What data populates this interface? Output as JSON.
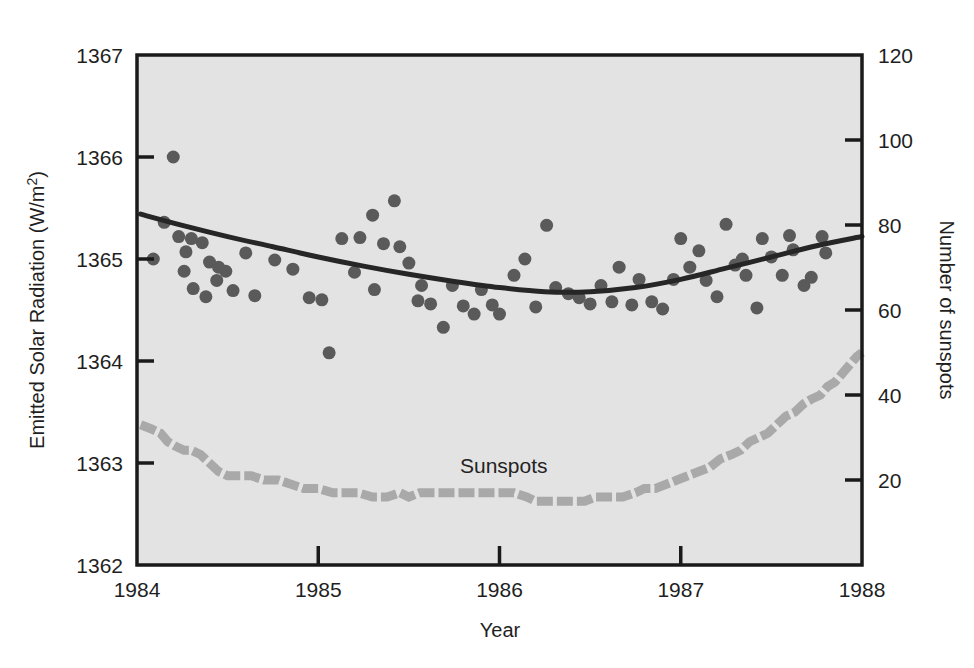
{
  "figure": {
    "background_color": "#ffffff",
    "plot_background_color": "#e3e3e3",
    "frame_color": "#1a1a1a"
  },
  "axes": {
    "left": {
      "title_main": "Emitted Solar Radiation (W/m",
      "title_sup": "2",
      "title_close": ")",
      "ticks": [
        "1367",
        "1366",
        "1365",
        "1364",
        "1363",
        "1362"
      ],
      "min": 1362,
      "max": 1367
    },
    "right": {
      "title": "Number of sunspots",
      "ticks": [
        "120",
        "100",
        "80",
        "60",
        "40",
        "20"
      ],
      "min": 0,
      "max": 120
    },
    "bottom": {
      "title": "Year",
      "ticks": [
        "1984",
        "1985",
        "1986",
        "1987",
        "1988"
      ],
      "min": 1984,
      "max": 1988
    }
  },
  "annotations": [
    {
      "name": "sunspots-label",
      "text": "Sunspots",
      "x": 460,
      "y": 473
    }
  ],
  "colors": {
    "scatter_marker": "#5a5a5a",
    "trend_line": "#262626",
    "sunspot_line": "#a9a9a9",
    "axis_text": "#1f1f1f"
  },
  "chart_data": {
    "type": "scatter",
    "title": "",
    "xlabel": "Year",
    "ylabel": "Emitted Solar Radiation (W/m2)",
    "ylabel_right": "Number of sunspots",
    "xlim": [
      1984,
      1988
    ],
    "ylim": [
      1362,
      1367
    ],
    "ylim_right": [
      0,
      120
    ],
    "grid": false,
    "legend": "none",
    "series": [
      {
        "name": "Emitted Solar Radiation",
        "type": "scatter",
        "axis": "left",
        "marker": "circle",
        "color": "#5a5a5a",
        "points": [
          [
            1984.09,
            1365.0
          ],
          [
            1984.15,
            1365.36
          ],
          [
            1984.2,
            1366.0
          ],
          [
            1984.23,
            1365.22
          ],
          [
            1984.27,
            1365.07
          ],
          [
            1984.26,
            1364.88
          ],
          [
            1984.3,
            1365.2
          ],
          [
            1984.36,
            1365.16
          ],
          [
            1984.31,
            1364.71
          ],
          [
            1984.4,
            1364.97
          ],
          [
            1984.45,
            1364.92
          ],
          [
            1984.49,
            1364.88
          ],
          [
            1984.44,
            1364.79
          ],
          [
            1984.38,
            1364.63
          ],
          [
            1984.53,
            1364.69
          ],
          [
            1984.6,
            1365.06
          ],
          [
            1984.65,
            1364.64
          ],
          [
            1984.76,
            1364.99
          ],
          [
            1984.86,
            1364.9
          ],
          [
            1984.95,
            1364.62
          ],
          [
            1985.02,
            1364.6
          ],
          [
            1985.06,
            1364.08
          ],
          [
            1985.13,
            1365.2
          ],
          [
            1985.2,
            1364.87
          ],
          [
            1985.23,
            1365.21
          ],
          [
            1985.3,
            1365.43
          ],
          [
            1985.31,
            1364.7
          ],
          [
            1985.36,
            1365.15
          ],
          [
            1985.42,
            1365.57
          ],
          [
            1985.45,
            1365.12
          ],
          [
            1985.5,
            1364.96
          ],
          [
            1985.55,
            1364.59
          ],
          [
            1985.57,
            1364.74
          ],
          [
            1985.62,
            1364.56
          ],
          [
            1985.69,
            1364.33
          ],
          [
            1985.74,
            1364.74
          ],
          [
            1985.8,
            1364.54
          ],
          [
            1985.86,
            1364.46
          ],
          [
            1985.9,
            1364.7
          ],
          [
            1985.96,
            1364.55
          ],
          [
            1986.0,
            1364.46
          ],
          [
            1986.08,
            1364.84
          ],
          [
            1986.14,
            1365.0
          ],
          [
            1986.2,
            1364.53
          ],
          [
            1986.26,
            1365.33
          ],
          [
            1986.31,
            1364.72
          ],
          [
            1986.38,
            1364.66
          ],
          [
            1986.44,
            1364.62
          ],
          [
            1986.5,
            1364.56
          ],
          [
            1986.56,
            1364.74
          ],
          [
            1986.62,
            1364.58
          ],
          [
            1986.66,
            1364.92
          ],
          [
            1986.73,
            1364.55
          ],
          [
            1986.77,
            1364.8
          ],
          [
            1986.84,
            1364.58
          ],
          [
            1986.9,
            1364.51
          ],
          [
            1986.96,
            1364.8
          ],
          [
            1987.0,
            1365.2
          ],
          [
            1987.05,
            1364.92
          ],
          [
            1987.1,
            1365.08
          ],
          [
            1987.14,
            1364.79
          ],
          [
            1987.2,
            1364.63
          ],
          [
            1987.25,
            1365.34
          ],
          [
            1987.3,
            1364.94
          ],
          [
            1987.34,
            1365.0
          ],
          [
            1987.36,
            1364.84
          ],
          [
            1987.42,
            1364.52
          ],
          [
            1987.45,
            1365.2
          ],
          [
            1987.5,
            1365.02
          ],
          [
            1987.56,
            1364.84
          ],
          [
            1987.6,
            1365.23
          ],
          [
            1987.62,
            1365.09
          ],
          [
            1987.68,
            1364.74
          ],
          [
            1987.72,
            1364.82
          ],
          [
            1987.78,
            1365.22
          ],
          [
            1987.8,
            1365.06
          ]
        ]
      },
      {
        "name": "Solar radiation trend",
        "type": "line",
        "axis": "left",
        "color": "#262626",
        "style": "solid",
        "points": [
          [
            1984.02,
            1365.44
          ],
          [
            1984.25,
            1365.33
          ],
          [
            1984.5,
            1365.22
          ],
          [
            1984.75,
            1365.12
          ],
          [
            1985.0,
            1365.02
          ],
          [
            1985.25,
            1364.93
          ],
          [
            1985.5,
            1364.85
          ],
          [
            1985.75,
            1364.78
          ],
          [
            1986.0,
            1364.72
          ],
          [
            1986.25,
            1364.68
          ],
          [
            1986.5,
            1364.68
          ],
          [
            1986.75,
            1364.72
          ],
          [
            1987.0,
            1364.8
          ],
          [
            1987.25,
            1364.91
          ],
          [
            1987.5,
            1365.02
          ],
          [
            1987.75,
            1365.13
          ],
          [
            1988.0,
            1365.22
          ]
        ]
      },
      {
        "name": "Sunspots",
        "type": "line",
        "axis": "right",
        "color": "#a9a9a9",
        "style": "dashed-thick",
        "points": [
          [
            1984.02,
            33
          ],
          [
            1984.08,
            32
          ],
          [
            1984.13,
            31
          ],
          [
            1984.17,
            29
          ],
          [
            1984.21,
            28
          ],
          [
            1984.26,
            27
          ],
          [
            1984.3,
            27
          ],
          [
            1984.35,
            26
          ],
          [
            1984.4,
            24
          ],
          [
            1984.45,
            22
          ],
          [
            1984.5,
            21
          ],
          [
            1984.57,
            21
          ],
          [
            1984.63,
            21
          ],
          [
            1984.7,
            20
          ],
          [
            1984.78,
            20
          ],
          [
            1984.85,
            19
          ],
          [
            1984.92,
            18
          ],
          [
            1985.0,
            18
          ],
          [
            1985.08,
            17
          ],
          [
            1985.15,
            17
          ],
          [
            1985.22,
            17
          ],
          [
            1985.3,
            16
          ],
          [
            1985.38,
            16
          ],
          [
            1985.45,
            17
          ],
          [
            1985.5,
            16
          ],
          [
            1985.56,
            17
          ],
          [
            1985.62,
            17
          ],
          [
            1985.7,
            17
          ],
          [
            1985.8,
            17
          ],
          [
            1985.9,
            17
          ],
          [
            1986.0,
            17
          ],
          [
            1986.08,
            17
          ],
          [
            1986.15,
            16
          ],
          [
            1986.2,
            15
          ],
          [
            1986.26,
            15
          ],
          [
            1986.33,
            15
          ],
          [
            1986.4,
            15
          ],
          [
            1986.47,
            15
          ],
          [
            1986.53,
            16
          ],
          [
            1986.6,
            16
          ],
          [
            1986.68,
            16
          ],
          [
            1986.75,
            17
          ],
          [
            1986.8,
            18
          ],
          [
            1986.86,
            18
          ],
          [
            1986.92,
            19
          ],
          [
            1986.98,
            20
          ],
          [
            1987.04,
            21
          ],
          [
            1987.1,
            22
          ],
          [
            1987.16,
            23
          ],
          [
            1987.22,
            25
          ],
          [
            1987.28,
            26
          ],
          [
            1987.33,
            27
          ],
          [
            1987.38,
            29
          ],
          [
            1987.43,
            30
          ],
          [
            1987.48,
            31
          ],
          [
            1987.53,
            33
          ],
          [
            1987.58,
            35
          ],
          [
            1987.63,
            36
          ],
          [
            1987.68,
            38
          ],
          [
            1987.72,
            39
          ],
          [
            1987.77,
            40
          ],
          [
            1987.81,
            42
          ],
          [
            1987.85,
            43
          ],
          [
            1987.89,
            45
          ],
          [
            1987.93,
            47
          ],
          [
            1987.97,
            49
          ],
          [
            1988.0,
            50
          ]
        ]
      }
    ]
  }
}
